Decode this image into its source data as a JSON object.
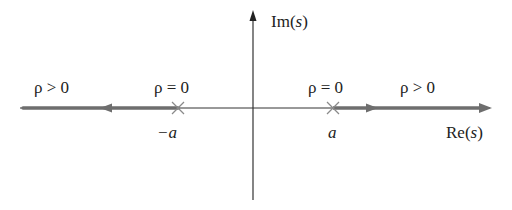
{
  "diagram": {
    "type": "root-locus",
    "axes": {
      "real_label_prefix": "Re",
      "imag_label_prefix": "Im",
      "var": "s"
    },
    "poles": [
      {
        "label": "−a",
        "value": "-a",
        "marker": "x"
      },
      {
        "label": "a",
        "value": "a",
        "marker": "x"
      }
    ],
    "annotations": [
      {
        "id": "left-far",
        "text": "ρ > 0"
      },
      {
        "id": "left-pole",
        "text": "ρ = 0"
      },
      {
        "id": "right-pole",
        "text": "ρ = 0"
      },
      {
        "id": "right-far",
        "text": "ρ > 0"
      }
    ],
    "branches": [
      {
        "from": "-a",
        "direction": "left",
        "label": "ρ > 0"
      },
      {
        "from": "a",
        "direction": "right",
        "label": "ρ > 0"
      }
    ],
    "colors": {
      "axis": "#222222",
      "locus": "#6e6e6e",
      "marker": "#8a8a8a"
    }
  }
}
